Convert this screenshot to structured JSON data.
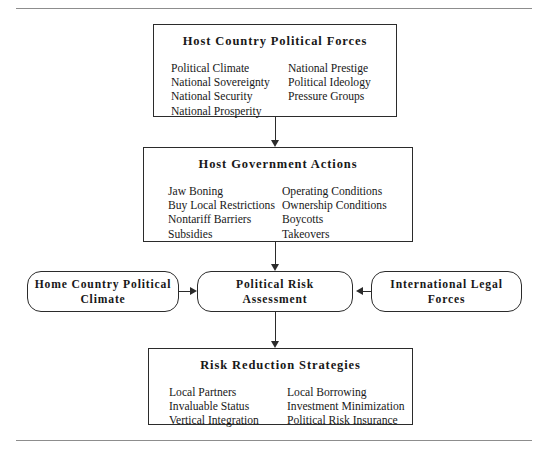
{
  "diagram": {
    "nodes": {
      "host_forces": {
        "title": "Host Country Political Forces",
        "columns": [
          [
            "Political Climate",
            "National Sovereignty",
            "National Security",
            "National Prosperity"
          ],
          [
            "National Prestige",
            "Political Ideology",
            "Pressure Groups"
          ]
        ]
      },
      "gov_actions": {
        "title": "Host Government Actions",
        "columns": [
          [
            "Jaw Boning",
            "Buy Local Restrictions",
            "Nontariff Barriers",
            "Subsidies"
          ],
          [
            "Operating Conditions",
            "Ownership Conditions",
            "Boycotts",
            "Takeovers"
          ]
        ]
      },
      "home_climate": {
        "title": "Home Country Political Climate"
      },
      "risk_assessment": {
        "title": "Political Risk Assessment"
      },
      "international_legal": {
        "title": "International Legal Forces"
      },
      "risk_reduction": {
        "title": "Risk Reduction Strategies",
        "columns": [
          [
            "Local Partners",
            "Invaluable Status",
            "Vertical Integration"
          ],
          [
            "Local Borrowing",
            "Investment Minimization",
            "Political Risk Insurance"
          ]
        ]
      }
    },
    "colors": {
      "border": "#2b2b2b",
      "rule": "#8d8d8d",
      "text": "#181818",
      "background": "#ffffff"
    }
  }
}
